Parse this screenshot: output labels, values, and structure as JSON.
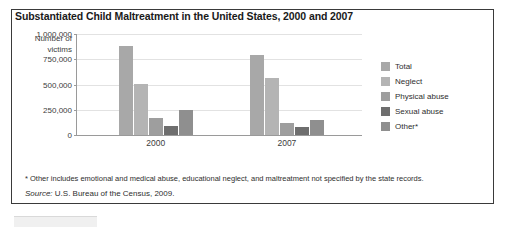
{
  "chart_data": {
    "type": "bar",
    "title": "Substantiated Child Maltreatment in the United States, 2000 and 2007",
    "xlabel": "",
    "ylabel": "Number of victims",
    "ylim": [
      0,
      1000000
    ],
    "ytick_labels": [
      "1,000,000",
      "750,000",
      "500,000",
      "250,000",
      "0"
    ],
    "ytick_values": [
      1000000,
      750000,
      500000,
      250000,
      0
    ],
    "grid": true,
    "legend_position": "right",
    "categories": [
      "2000",
      "2007"
    ],
    "series": [
      {
        "name": "Total",
        "color": "#a8a8a8",
        "values": [
          880000,
          790000
        ]
      },
      {
        "name": "Neglect",
        "color": "#b4b4b4",
        "values": [
          510000,
          560000
        ]
      },
      {
        "name": "Physical abuse",
        "color": "#9e9e9e",
        "values": [
          170000,
          120000
        ]
      },
      {
        "name": "Sexual abuse",
        "color": "#6e6e6e",
        "values": [
          90000,
          80000
        ]
      },
      {
        "name": "Other*",
        "color": "#8f8f8f",
        "values": [
          250000,
          150000
        ]
      }
    ],
    "footnote": "* Other includes emotional and medical abuse, educational neglect, and maltreatment not specified by the state records.",
    "source_word": "Source:",
    "source_text": " U.S. Bureau of the Census, 2009."
  }
}
